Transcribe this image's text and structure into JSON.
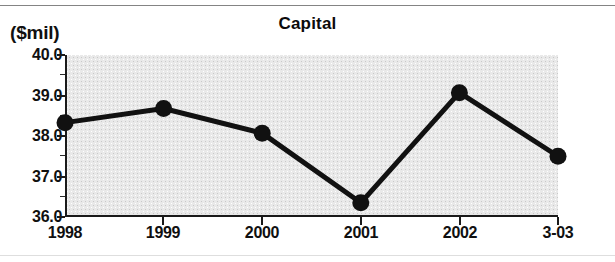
{
  "chart_data": {
    "type": "line",
    "title": "Capital",
    "xlabel": "",
    "ylabel": "($mil)",
    "categories": [
      "1998",
      "1999",
      "2000",
      "2001",
      "2002",
      "3-03"
    ],
    "values": [
      38.33,
      38.68,
      38.07,
      36.35,
      39.07,
      37.5
    ],
    "series": [
      {
        "name": "Capital",
        "values": [
          38.33,
          38.68,
          38.07,
          36.35,
          39.07,
          37.5
        ]
      }
    ],
    "ylim": [
      36.0,
      40.0
    ],
    "ytick_labels": [
      "36.0",
      "37.0",
      "38.0",
      "39.0",
      "40.0"
    ],
    "ytick_values": [
      36.0,
      37.0,
      38.0,
      39.0,
      40.0
    ],
    "yminor_step": 0.5,
    "xtick_labels": [
      "1998",
      "1999",
      "2000",
      "2001",
      "2002",
      "3-03"
    ],
    "grid": false,
    "legend": null,
    "legend_position": "none",
    "marker": "filled-circle",
    "units_note": "($mil)",
    "colors": {
      "line": "#111111",
      "marker": "#111111",
      "plot_background": "#e9e9e9",
      "axis": "#1a1a1a",
      "text": "#101010"
    }
  }
}
